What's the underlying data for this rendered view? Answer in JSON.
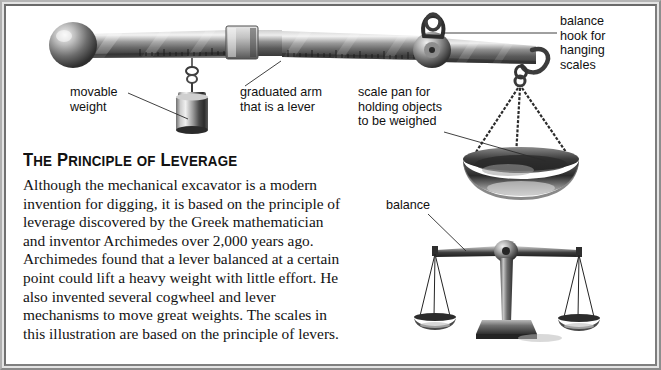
{
  "figure": {
    "heading": "THE PRINCIPLE OF LEVERAGE",
    "heading_parts": {
      "t1": "T",
      "t1r": "HE",
      "t2": "P",
      "t2r": "RINCIPLE",
      "t3": "OF",
      "t4": "L",
      "t4r": "EVERAGE"
    },
    "body": "Although the mechanical excavator is a modern invention for digging, it is based on the principle of leverage discovered by the Greek mathematician and inventor Archimedes over 2,000 years ago. Archimedes found that a lever balanced at a certain point could lift a heavy weight with little effort.  He also invented several cogwheel and lever mechanisms to move great weights.  The scales in this illustration are based on the principle of levers."
  },
  "callouts": {
    "movable_weight": "movable\nweight",
    "graduated_arm": "graduated arm\nthat is a lever",
    "scale_pan": "scale pan for\nholding objects\nto be weighed",
    "balance_hook": "balance\nhook for\nhanging\nscales",
    "balance": "balance"
  },
  "illustration": {
    "parts": [
      "steelyard-beam",
      "counterweight-ball",
      "graduation-marks",
      "sliding-rider",
      "movable-weight-cylinder",
      "fulcrum-disc",
      "suspension-loop",
      "load-hook",
      "scale-pan-bowl",
      "pan-chains",
      "balance-beam",
      "balance-pillar",
      "balance-base",
      "balance-pan-left",
      "balance-pan-right"
    ]
  },
  "colors": {
    "frame_outer": "#9a9a9a",
    "frame_highlight": "#e4e4e4",
    "frame_inner": "#6f6f6f",
    "text": "#121212",
    "metal_dark": "#3a3a3a",
    "metal_mid": "#8d8d8d",
    "metal_light": "#e8e8e8",
    "background": "#ffffff"
  }
}
